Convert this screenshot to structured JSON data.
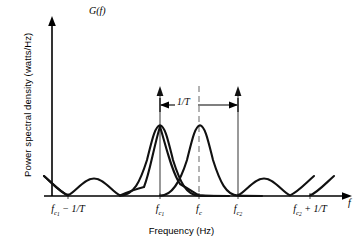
{
  "figure": {
    "y_axis_symbol": "G(f)",
    "x_axis_symbol": "f",
    "ylabel": "Power spectral density (watts/Hz)",
    "xlabel": "Frequency (Hz)",
    "span_annotation": "1/T",
    "axis_color": "#000000",
    "curve_color": "#000000",
    "impulse_color": "#555555",
    "dashed_color": "#999999"
  },
  "ticks": [
    {
      "id": "fc1-minus-1overT",
      "base": "f",
      "sub": "c",
      "subsub": "1",
      "suffix": " − 1/T",
      "x": 68
    },
    {
      "id": "fc1",
      "base": "f",
      "sub": "c",
      "subsub": "1",
      "suffix": "",
      "x": 160
    },
    {
      "id": "fc",
      "base": "f",
      "sub": "c",
      "subsub": "",
      "suffix": "",
      "x": 199
    },
    {
      "id": "fc2",
      "base": "f",
      "sub": "c",
      "subsub": "2",
      "suffix": "",
      "x": 238
    },
    {
      "id": "fc2-plus-1overT",
      "base": "f",
      "sub": "c",
      "subsub": "2",
      "suffix": " + 1/T",
      "x": 310
    }
  ],
  "chart_data": {
    "type": "line",
    "title": "",
    "xlabel": "Frequency (Hz)",
    "ylabel": "Power spectral density (watts/Hz)",
    "xlim": [
      44,
      352
    ],
    "ylim": [
      196,
      88
    ],
    "grid": false,
    "legend": null,
    "axis": {
      "x_baseline_y": 196,
      "y_axis_x": 52,
      "y_arrow_tip_y": 18,
      "x_arrow_tip_x": 350
    },
    "tick_x_positions": [
      68,
      160,
      199,
      238,
      310
    ],
    "tick_labels": [
      "f_c1 - 1/T",
      "f_c1",
      "f_c",
      "f_c2",
      "f_c2 + 1/T"
    ],
    "annotations": [
      {
        "text": "1/T",
        "type": "double-arrow-span",
        "from_x": 160,
        "to_x": 238,
        "y": 105
      },
      {
        "text": "G(f)",
        "type": "axis-symbol",
        "x": 89,
        "y": 6
      },
      {
        "text": "f",
        "type": "axis-symbol",
        "x": 348,
        "y": 198
      }
    ],
    "series": [
      {
        "name": "lobe-centered-fc1",
        "type": "raised-cosine-spectrum",
        "center_x": 160,
        "main_lobe_peak_y": 125,
        "side_lobe_peak_y": 178,
        "nulls_x": [
          68,
          160,
          238,
          310
        ],
        "baseline_y": 196
      },
      {
        "name": "lobe-centered-fc2",
        "type": "raised-cosine-spectrum",
        "center_x": 238,
        "main_lobe_peak_y": 125,
        "side_lobe_peak_y": 178,
        "nulls_x": [
          68,
          160,
          238,
          310
        ],
        "baseline_y": 196
      }
    ],
    "impulses": [
      {
        "name": "impulse-fc1",
        "x": 160,
        "top_y": 88,
        "base_y": 196
      },
      {
        "name": "impulse-fc2",
        "x": 238,
        "top_y": 88,
        "base_y": 196
      }
    ],
    "reference_lines": [
      {
        "name": "fc-center-dashed",
        "x": 199,
        "top_y": 88,
        "bottom_y": 196,
        "style": "dashed"
      }
    ]
  }
}
